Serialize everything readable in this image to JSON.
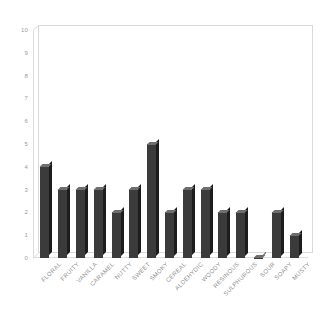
{
  "chart_data": {
    "type": "bar",
    "title": "",
    "subtitle": "",
    "xlabel": "",
    "ylabel": "",
    "ylim": [
      0,
      10
    ],
    "ytick_labels": [
      "10",
      "9",
      "8",
      "7",
      "6",
      "5",
      "4",
      "3",
      "2",
      "1",
      "0"
    ],
    "ytick_values": [
      10,
      9,
      8,
      7,
      6,
      5,
      4,
      3,
      2,
      1,
      0
    ],
    "grid": false,
    "legend": null,
    "style": "3d-column",
    "bar_color": "#3b3b3b",
    "bar_side_color": "#1c1c1c",
    "bar_top_color": "#6e6e6e",
    "frame_color": "#d9d9d9",
    "tick_label_color": "#9a9a9a",
    "categories": [
      "FLORAL",
      "FRUITY",
      "VANILLA",
      "CARAMEL",
      "NUTTY",
      "SWEET",
      "SMOKY",
      "CEREAL",
      "ALDEHYDIC",
      "WOODY",
      "RESINOUS",
      "SULPHUROUS",
      "SOUR",
      "SOAPY",
      "MUSTY"
    ],
    "values": [
      4,
      3,
      3,
      3,
      2,
      3,
      5,
      2,
      3,
      3,
      2,
      2,
      0,
      2,
      1
    ]
  }
}
